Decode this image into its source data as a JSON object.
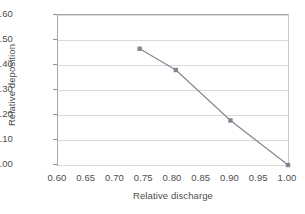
{
  "chart_data": {
    "type": "line",
    "title": "",
    "xlabel": "Relative discharge",
    "ylabel": "Relative deposition",
    "xlim": [
      0.6,
      1.0
    ],
    "ylim": [
      0.0,
      0.6
    ],
    "grid": true,
    "legend": "none",
    "marker": "square",
    "series_color": "#8b8194",
    "x": [
      0.742,
      0.805,
      0.9,
      1.0
    ],
    "values": [
      0.465,
      0.38,
      0.178,
      0.0
    ],
    "points": [
      {
        "x": 0.742,
        "y": 0.465
      },
      {
        "x": 0.805,
        "y": 0.38
      },
      {
        "x": 0.9,
        "y": 0.178
      },
      {
        "x": 1.0,
        "y": 0.0
      }
    ],
    "xticks": [
      "0.60",
      "0.65",
      "0.70",
      "0.75",
      "0.80",
      "0.85",
      "0.90",
      "0.95",
      "1.00"
    ],
    "xtick_values": [
      0.6,
      0.65,
      0.7,
      0.75,
      0.8,
      0.85,
      0.9,
      0.95,
      1.0
    ],
    "yticks": [
      "0.00",
      "0.10",
      "0.20",
      "0.30",
      "0.40",
      "0.50",
      "0.60"
    ],
    "ytick_values": [
      0.0,
      0.1,
      0.2,
      0.3,
      0.4,
      0.5,
      0.6
    ]
  },
  "colors": {
    "series": "#8b8194",
    "grid": "#d9d9d9",
    "axis": "#a8a8a8",
    "text": "#4d4d4d",
    "background": "#ffffff"
  }
}
